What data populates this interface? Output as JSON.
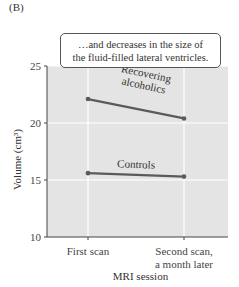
{
  "panel_label": "(B)",
  "annotation": {
    "line1": "…and decreases in the size of",
    "line2": "the fluid-filled lateral ventricles."
  },
  "colors": {
    "plot_background": "#e4e4e4",
    "gridline": "#ffffff",
    "series_line": "#5a5a5a",
    "axis": "#444444"
  },
  "chart_data": {
    "type": "line",
    "title": "",
    "xlabel": "MRI session",
    "ylabel": "Volume (cm³)",
    "categories": [
      "First scan",
      "Second scan, a month later"
    ],
    "category_lines": [
      [
        "First scan"
      ],
      [
        "Second scan,",
        "a month later"
      ]
    ],
    "ylim": [
      10,
      25
    ],
    "yticks": [
      10,
      15,
      20,
      25
    ],
    "grid": true,
    "legend": "none (direct labels on lines)",
    "series": [
      {
        "name": "Recovering alcoholics",
        "label_lines": [
          "Recovering",
          "alcoholics"
        ],
        "values": [
          22.1,
          20.4
        ]
      },
      {
        "name": "Controls",
        "label_lines": [
          "Controls"
        ],
        "values": [
          15.6,
          15.3
        ]
      }
    ]
  }
}
